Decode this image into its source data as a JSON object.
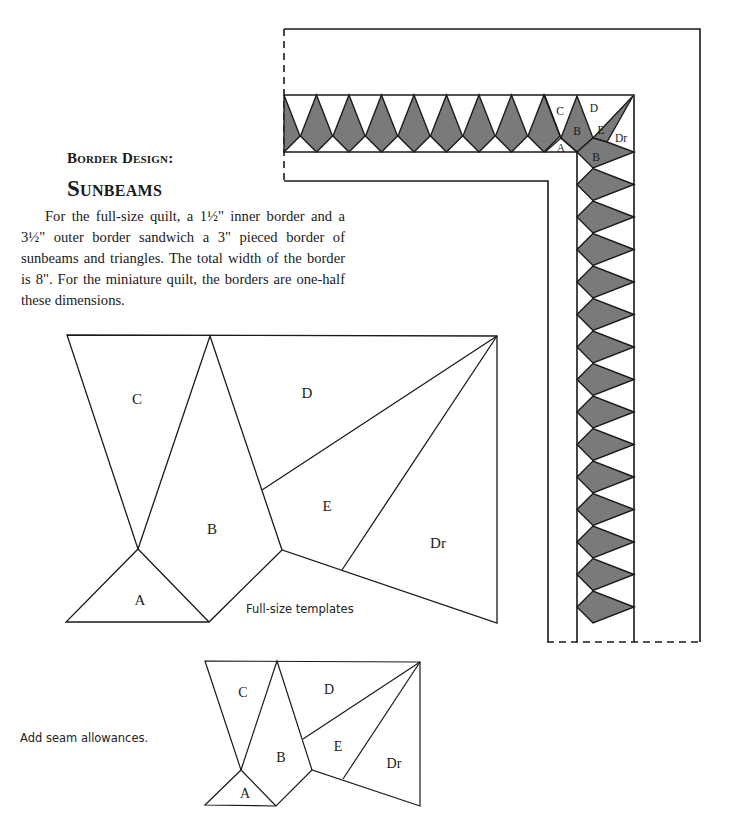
{
  "header": {
    "kicker": "Border Design:",
    "title": "Sunbeams"
  },
  "body": {
    "paragraph": "For the full-size quilt, a 1½\" inner border and a 3½\" outer border sandwich a 3\" pieced border of sunbeams and triangles. The total width of the border is 8\". For the miniature quilt, the borders are one-half these dimensions."
  },
  "border_diagram": {
    "fill_color": "#7a7a7a",
    "line_color": "#1a1a1a",
    "corner_labels": [
      "C",
      "D",
      "B",
      "E",
      "Dr",
      "A",
      "B"
    ]
  },
  "templates_full": {
    "caption": "Full-size templates",
    "labels": {
      "A": "A",
      "B": "B",
      "C": "C",
      "D": "D",
      "E": "E",
      "Dr": "Dr"
    }
  },
  "templates_mini": {
    "caption": "Add seam allowances.",
    "labels": {
      "A": "A",
      "B": "B",
      "C": "C",
      "D": "D",
      "E": "E",
      "Dr": "Dr"
    }
  }
}
